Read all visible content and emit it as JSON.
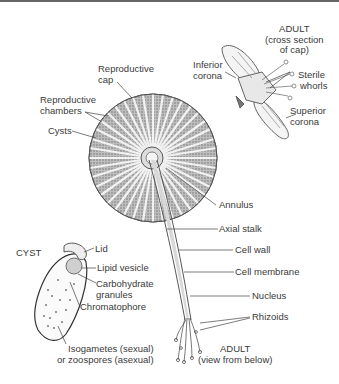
{
  "diagram": {
    "adult_cross_section": {
      "title_line1": "ADULT",
      "title_line2": "(cross section",
      "title_line3": "of cap)",
      "labels": {
        "inferior_corona_1": "Inferior",
        "inferior_corona_2": "corona",
        "sterile_whorls_1": "Sterile",
        "sterile_whorls_2": "whorls",
        "superior_corona_1": "Superior",
        "superior_corona_2": "corona"
      }
    },
    "adult_below": {
      "title_line1": "ADULT",
      "title_line2": "(view from below)",
      "labels": {
        "reproductive_cap_1": "Reproductive",
        "reproductive_cap_2": "cap",
        "reproductive_chambers_1": "Reproductive",
        "reproductive_chambers_2": "chambers",
        "cysts": "Cysts",
        "annulus": "Annulus",
        "axial_stalk": "Axial stalk",
        "cell_wall": "Cell wall",
        "cell_membrane": "Cell membrane",
        "nucleus": "Nucleus",
        "rhizoids": "Rhizoids"
      }
    },
    "cyst": {
      "title": "CYST",
      "labels": {
        "lid": "Lid",
        "lipid_vesicle": "Lipid vesicle",
        "carbohydrate_1": "Carbohydrate",
        "carbohydrate_2": "granules",
        "chromatophore": "Chromatophore",
        "isogametes_1": "Isogametes (sexual)",
        "isogametes_2": "or zoospores (asexual)"
      }
    }
  }
}
